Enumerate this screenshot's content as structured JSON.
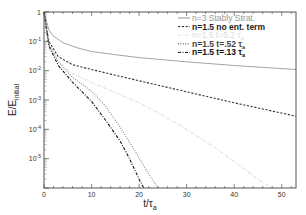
{
  "chart_data": {
    "type": "line",
    "title": "",
    "xlabel": "t/τa",
    "ylabel": "E/Einitial",
    "xlim": [
      0,
      53
    ],
    "ylim": [
      1e-06,
      1
    ],
    "yscale": "log",
    "x_ticks": [
      "0",
      "10",
      "20",
      "30",
      "40",
      "50"
    ],
    "y_ticks": [
      "1",
      "10-1",
      "10-2",
      "10-3",
      "10-4",
      "10-5"
    ],
    "grid": false,
    "legend_position": "upper right",
    "series": [
      {
        "name": "n=3 Stably Strat.",
        "style": "solid",
        "color": "#999999",
        "x": [
          0,
          0.5,
          1,
          2,
          4,
          7,
          10,
          15,
          20,
          30,
          40,
          53
        ],
        "y": [
          1,
          0.5,
          0.25,
          0.15,
          0.09,
          0.06,
          0.045,
          0.035,
          0.028,
          0.02,
          0.015,
          0.011
        ]
      },
      {
        "name": "n=1.5 no ent. term",
        "style": "dashed",
        "color": "#333333",
        "x": [
          0,
          1,
          3,
          6,
          10,
          15,
          20,
          30,
          40,
          53
        ],
        "y": [
          1,
          0.1,
          0.03,
          0.016,
          0.011,
          0.007,
          0.0045,
          0.0019,
          0.0008,
          0.00028
        ]
      },
      {
        "name": "n=1.5 t=5.2 τa",
        "style": "dash-dot",
        "color": "#dddddd",
        "x": [
          0,
          1,
          3,
          6,
          10,
          15,
          20,
          25,
          30,
          35,
          40,
          45,
          48
        ],
        "y": [
          1,
          0.09,
          0.02,
          0.008,
          0.004,
          0.0018,
          0.0008,
          0.0003,
          0.0001,
          3e-05,
          8e-06,
          2e-06,
          1e-06
        ]
      },
      {
        "name": "n=1.5 t=.52 τa",
        "style": "dotted",
        "color": "#888888",
        "x": [
          0,
          1,
          3,
          6,
          10,
          13,
          16,
          19,
          22,
          24
        ],
        "y": [
          1,
          0.08,
          0.02,
          0.006,
          0.002,
          0.0006,
          0.00012,
          2e-05,
          3e-06,
          1e-06
        ]
      },
      {
        "name": "n=1.5 t=.13 τa",
        "style": "dash-dot",
        "color": "#111111",
        "x": [
          0,
          1,
          3,
          6,
          10,
          13,
          16,
          18,
          20,
          21
        ],
        "y": [
          1,
          0.07,
          0.015,
          0.004,
          0.0009,
          0.0002,
          4e-05,
          1e-05,
          2e-06,
          1e-06
        ]
      }
    ]
  },
  "legend": [
    {
      "label": "n=3 Stably Strat.",
      "color": "#999999",
      "bold": false
    },
    {
      "label": "n=1.5 no ent. term",
      "color": "#222222",
      "bold": true
    },
    {
      "label": "n=1.5 t=5.2 τa",
      "color": "#dddddd",
      "bold": false
    },
    {
      "label": "n=1.5 t=.52 τa",
      "color": "#444444",
      "bold": true
    },
    {
      "label": "n=1.5 t=.13 τa",
      "color": "#111111",
      "bold": true
    }
  ],
  "axes": {
    "xlabel_main": "t/τ",
    "xlabel_sub": "a",
    "ylabel_main": "E/E",
    "ylabel_sub": "initial"
  }
}
